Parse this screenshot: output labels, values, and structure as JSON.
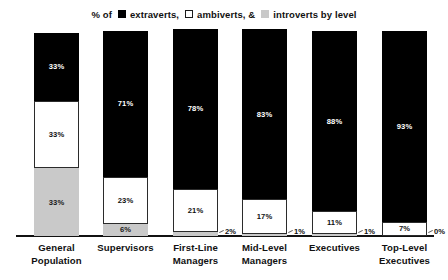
{
  "legend": {
    "prefix": "% of",
    "items": [
      {
        "swatch": "black-square-icon",
        "label": "extraverts,",
        "color": "#000000"
      },
      {
        "swatch": "white-square-icon",
        "label": "ambiverts, &",
        "color": "#ffffff"
      },
      {
        "swatch": "gray-square-icon",
        "label": "introverts by level",
        "color": "#c9c9c9"
      }
    ]
  },
  "chart_data": {
    "type": "bar",
    "title": "% of extraverts, ambiverts, & introverts by level",
    "subtype": "stacked-100-percent",
    "xlabel": "",
    "ylabel": "",
    "ylim": [
      0,
      100
    ],
    "grid": false,
    "legend_position": "top-center",
    "categories": [
      "General Population",
      "Supervisors",
      "First-Line Managers",
      "Mid-Level Managers",
      "Executives",
      "Top-Level Executives"
    ],
    "category_lines": [
      [
        "General",
        "Population"
      ],
      [
        "Supervisors",
        ""
      ],
      [
        "First-Line",
        "Managers"
      ],
      [
        "Mid-Level",
        "Managers"
      ],
      [
        "Executives",
        ""
      ],
      [
        "Top-Level",
        "Executives"
      ]
    ],
    "series": [
      {
        "name": "extraverts",
        "color": "#000000",
        "values": [
          33,
          71,
          78,
          83,
          88,
          93
        ]
      },
      {
        "name": "ambiverts",
        "color": "#ffffff",
        "values": [
          33,
          23,
          21,
          17,
          11,
          7
        ]
      },
      {
        "name": "introverts",
        "color": "#c9c9c9",
        "values": [
          33,
          6,
          2,
          1,
          1,
          0
        ]
      }
    ],
    "data_labels": {
      "extraverts": [
        "33%",
        "71%",
        "78%",
        "83%",
        "88%",
        "93%"
      ],
      "ambiverts": [
        "33%",
        "23%",
        "21%",
        "17%",
        "11%",
        "7%"
      ],
      "introverts": [
        "33%",
        "6%",
        "2%",
        "1%",
        "1%",
        "0%"
      ]
    },
    "introvert_label_placement": [
      "inside",
      "inside",
      "outside",
      "outside",
      "outside",
      "outside"
    ]
  }
}
